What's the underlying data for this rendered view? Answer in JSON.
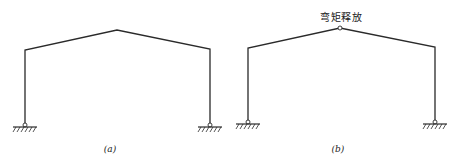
{
  "figure": {
    "panels": [
      {
        "id": "a",
        "caption": "(a)",
        "structure": "gable-portal-frame",
        "left_support": "pin-support",
        "right_support": "pin-support",
        "apex_annotation": null
      },
      {
        "id": "b",
        "caption": "(b)",
        "structure": "gable-portal-frame-with-hinge",
        "left_support": "pin-support",
        "right_support": "pin-support",
        "apex_annotation": "弯矩释放"
      }
    ],
    "colors": {
      "line": "#2a2a2a",
      "background": "#ffffff"
    }
  }
}
